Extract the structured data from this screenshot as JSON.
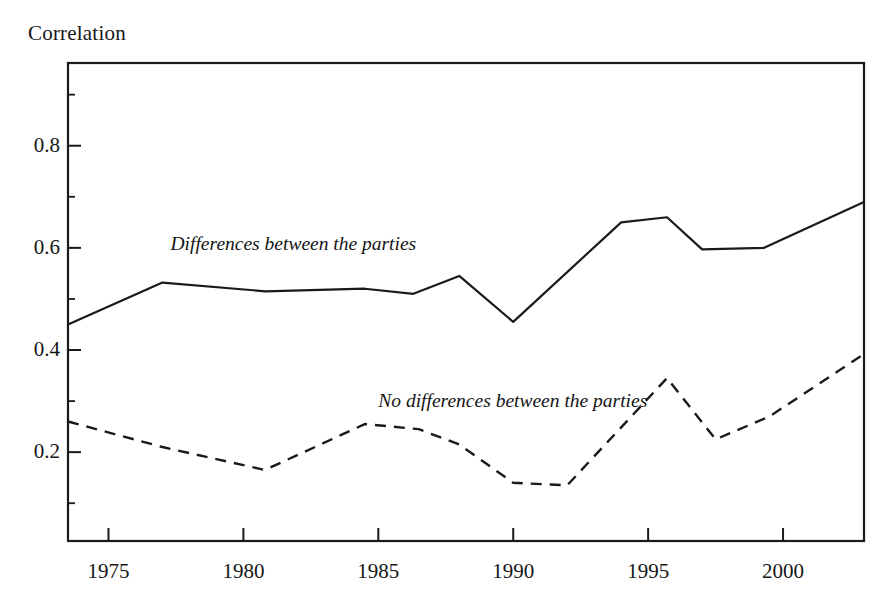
{
  "figure": {
    "y_axis_title": "Correlation",
    "background_color": "#ffffff",
    "line_color": "#1a1a1a"
  },
  "chart_data": {
    "type": "line",
    "title": "",
    "subtitle": "",
    "xlabel": "",
    "ylabel": "Correlation",
    "xlim": [
      1973.5,
      2003.0
    ],
    "ylim": [
      0.026,
      0.962
    ],
    "grid": false,
    "legend": "inline-labels",
    "xticks": [
      1975,
      1980,
      1985,
      1990,
      1995,
      2000
    ],
    "xtick_labels": [
      "1975",
      "1980",
      "1985",
      "1990",
      "1995",
      "2000"
    ],
    "yticks": [
      0.2,
      0.4,
      0.6,
      0.8
    ],
    "ytick_labels": [
      "0.2",
      "0.4",
      "0.6",
      "0.8"
    ],
    "minor_yticks": [
      0.1,
      0.3,
      0.5,
      0.7,
      0.9
    ],
    "series": [
      {
        "name": "Differences between the parties",
        "style": "solid",
        "label_x": 1977.3,
        "label_y": 0.607,
        "x": [
          1973.5,
          1977.0,
          1980.8,
          1984.5,
          1986.3,
          1988.0,
          1990.0,
          1994.0,
          1995.7,
          1997.0,
          1999.3,
          2003.0
        ],
        "y": [
          0.45,
          0.532,
          0.515,
          0.52,
          0.51,
          0.545,
          0.455,
          0.65,
          0.66,
          0.597,
          0.6,
          0.69
        ]
      },
      {
        "name": "No differences between the parties",
        "style": "dashed",
        "label_x": 1985.0,
        "label_y": 0.3,
        "x": [
          1973.5,
          1977.0,
          1980.8,
          1984.5,
          1986.5,
          1988.0,
          1990.0,
          1992.0,
          1995.7,
          1997.5,
          1999.5,
          2003.0
        ],
        "y": [
          0.26,
          0.21,
          0.165,
          0.255,
          0.245,
          0.215,
          0.14,
          0.135,
          0.345,
          0.225,
          0.27,
          0.392
        ]
      }
    ]
  }
}
